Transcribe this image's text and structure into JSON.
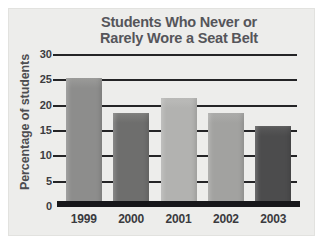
{
  "chart_data": {
    "type": "bar",
    "title": "Students Who Never or\nRarely Wore a Seat Belt",
    "title_line_1": "Students Who Never or",
    "title_line_2": "Rarely Wore a Seat Belt",
    "xlabel": "",
    "ylabel": "Percentage of students",
    "categories": [
      "1999",
      "2000",
      "2001",
      "2002",
      "2003"
    ],
    "values": [
      25.5,
      18.5,
      21.5,
      18.5,
      16
    ],
    "ylim": [
      0,
      30
    ],
    "ytick_labels": [
      "30",
      "25",
      "20",
      "15",
      "10",
      "5",
      "0"
    ],
    "ytick_values": [
      30,
      25,
      20,
      15,
      10,
      5,
      0
    ],
    "ytick_step": 5,
    "grid": true,
    "grid_axis": "y",
    "legend": false,
    "legend_position": "none",
    "bar_colors": [
      "#8d8d8c",
      "#6e6e6d",
      "#b2b2b0",
      "#a2a2a0",
      "#4c4c4d"
    ],
    "bar_cap_colors": [
      "#9b9b99",
      "#7e7e7c",
      "#bcbcba",
      "#acacaa",
      "#5a5a5a"
    ],
    "axis_color": "#17171a",
    "grid_color": "#242426",
    "title_color": "#55555a",
    "panel_color": "#ededeb",
    "figure_color": "#ffffff"
  }
}
